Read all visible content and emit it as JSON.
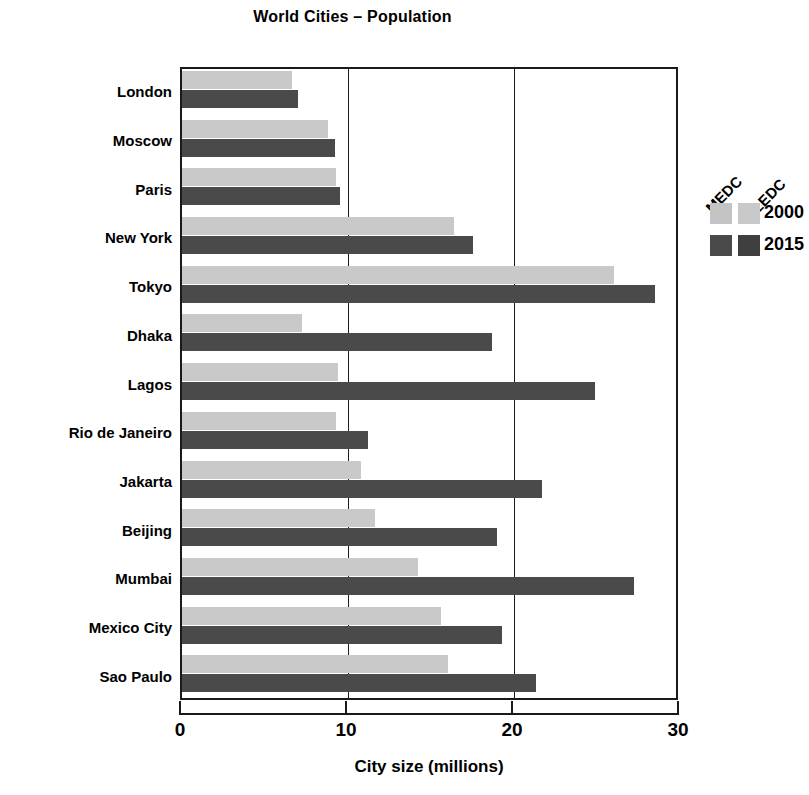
{
  "chart_data": {
    "type": "bar",
    "orientation": "horizontal",
    "title": "World Cities – Population",
    "xlabel": "City size (millions)",
    "ylabel": "",
    "xlim": [
      0,
      30
    ],
    "xticks": [
      0,
      10,
      20,
      30
    ],
    "xtick_labels": [
      "0",
      "10",
      "20",
      "30"
    ],
    "grid": "vertical gridlines at 10 and 20",
    "legend_position": "top-right inside plot",
    "legend_group_labels": [
      "MEDC",
      "LEDC"
    ],
    "categories": [
      "London",
      "Moscow",
      "Paris",
      "New York",
      "Tokyo",
      "Dhaka",
      "Lagos",
      "Rio de Janeiro",
      "Jakarta",
      "Beijing",
      "Mumbai",
      "Mexico City",
      "Sao Paulo"
    ],
    "series": [
      {
        "name": "2000",
        "color": "#c9c9c9",
        "values": [
          6.6,
          8.8,
          9.3,
          16.4,
          26.0,
          7.2,
          9.4,
          9.3,
          10.8,
          11.6,
          14.2,
          15.6,
          16.0
        ]
      },
      {
        "name": "2015",
        "color": "#4a4a4a",
        "values": [
          7.0,
          9.2,
          9.5,
          17.5,
          28.5,
          18.7,
          24.9,
          11.2,
          21.7,
          19.0,
          27.2,
          19.3,
          21.3
        ]
      }
    ],
    "city_class": [
      "MEDC",
      "MEDC",
      "MEDC",
      "MEDC",
      "MEDC",
      "LEDC",
      "LEDC",
      "LEDC",
      "LEDC",
      "LEDC",
      "LEDC",
      "LEDC",
      "LEDC"
    ]
  },
  "legend": {
    "rot_labels": [
      "MEDC",
      "LEDC"
    ],
    "rows": [
      {
        "year": "2000"
      },
      {
        "year": "2015"
      }
    ]
  },
  "colors": {
    "bar_2000": "#c9c9c9",
    "bar_2015": "#4a4a4a",
    "axis": "#1a1a1a",
    "background": "#ffffff"
  }
}
